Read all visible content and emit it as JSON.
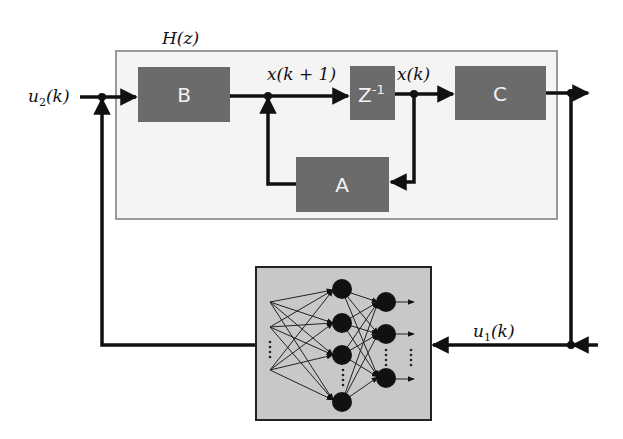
{
  "diagram": {
    "system_label": "H(z)",
    "colors": {
      "system_box_fill": "#f4f4f4",
      "system_box_border": "#9a9a9a",
      "block_fill": "#6b6b6b",
      "block_text": "#f2f2f2",
      "line": "#111111",
      "nn_box_fill": "#c8c8c8",
      "nn_box_border": "#222222",
      "neuron": "#111111"
    },
    "blocks": [
      {
        "id": "B",
        "label": "B"
      },
      {
        "id": "Z",
        "label": "Z",
        "superscript": "-1"
      },
      {
        "id": "C",
        "label": "C"
      },
      {
        "id": "A",
        "label": "A"
      },
      {
        "id": "NN",
        "label": "Neural network"
      }
    ],
    "signals": {
      "u2": {
        "base": "u",
        "sub": "2",
        "arg": "(k)"
      },
      "u1": {
        "base": "u",
        "sub": "1",
        "arg": "(k)"
      },
      "xk1": "x(k + 1)",
      "xk": "x(k)"
    },
    "neural_network": {
      "input_nodes": 3,
      "hidden_nodes": 4,
      "output_nodes": 3,
      "ellipsis": "⋮"
    },
    "edges": [
      {
        "from": "u2",
        "to": "B"
      },
      {
        "from": "B",
        "to": "Z",
        "label": "x(k + 1)"
      },
      {
        "from": "Z",
        "to": "C",
        "label": "x(k)"
      },
      {
        "from": "x(k)",
        "to": "A"
      },
      {
        "from": "A",
        "to": "x(k + 1) junction"
      },
      {
        "from": "C",
        "to": "output"
      },
      {
        "from": "output",
        "to": "NN",
        "label": "u1(k)"
      },
      {
        "from": "NN",
        "to": "u2 junction"
      }
    ]
  }
}
